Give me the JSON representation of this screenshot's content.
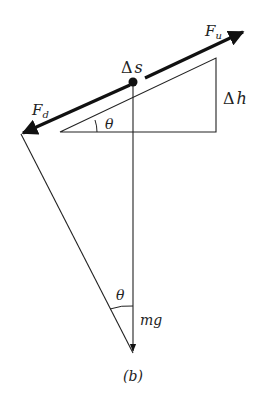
{
  "figure": {
    "caption": "(b)",
    "labels": {
      "force_up": "F",
      "force_up_sub": "u",
      "force_down": "F",
      "force_down_sub": "d",
      "delta_s_symbol": "Δ",
      "delta_s_var": "s",
      "delta_h_symbol": "Δ",
      "delta_h_var": "h",
      "angle_top": "θ",
      "angle_bottom": "θ",
      "weight": "mg"
    },
    "colors": {
      "line": "#222222",
      "background": "#ffffff"
    }
  }
}
